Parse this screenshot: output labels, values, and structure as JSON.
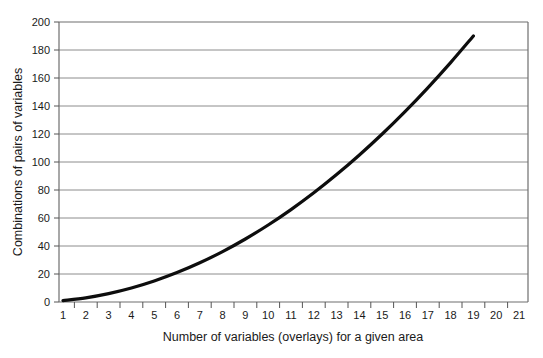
{
  "chart_data": {
    "type": "line",
    "title": "",
    "xlabel": "Number of variables (overlays) for a given area",
    "ylabel": "Combinations of pairs of variables",
    "xlim": [
      1,
      21
    ],
    "ylim": [
      0,
      200
    ],
    "grid": "horizontal",
    "legend": "none",
    "xticks": [
      "1",
      "2",
      "3",
      "4",
      "5",
      "6",
      "7",
      "8",
      "9",
      "10",
      "11",
      "12",
      "13",
      "14",
      "15",
      "16",
      "17",
      "18",
      "19",
      "20",
      "21"
    ],
    "yticks": [
      "0",
      "20",
      "40",
      "60",
      "80",
      "100",
      "120",
      "140",
      "160",
      "180",
      "200"
    ],
    "series": [
      {
        "name": "Combinations of pairs",
        "color": "#0d0d0d",
        "x": [
          1,
          2,
          3,
          4,
          5,
          6,
          7,
          8,
          9,
          10,
          11,
          12,
          13,
          14,
          15,
          16,
          17,
          18,
          19
        ],
        "values": [
          1,
          3,
          6,
          10,
          15,
          21,
          28,
          36,
          45,
          55,
          66,
          78,
          91,
          105,
          120,
          136,
          153,
          171,
          190
        ]
      }
    ]
  },
  "axes": {
    "y_axis_title": "Combinations of pairs of variables",
    "x_axis_title": "Number of variables (overlays) for a given area",
    "y_tick_labels": [
      "200",
      "180",
      "160",
      "140",
      "120",
      "100",
      "80",
      "60",
      "40",
      "20",
      "0"
    ],
    "x_tick_labels": [
      "1",
      "2",
      "3",
      "4",
      "5",
      "6",
      "7",
      "8",
      "9",
      "10",
      "11",
      "12",
      "13",
      "14",
      "15",
      "16",
      "17",
      "18",
      "19",
      "20",
      "21"
    ]
  },
  "colors": {
    "curve": "#0d0d0d",
    "gridline": "#8c8c8c",
    "frame": "#6e6e6e",
    "text": "#1a1a1a",
    "background": "#ffffff"
  }
}
